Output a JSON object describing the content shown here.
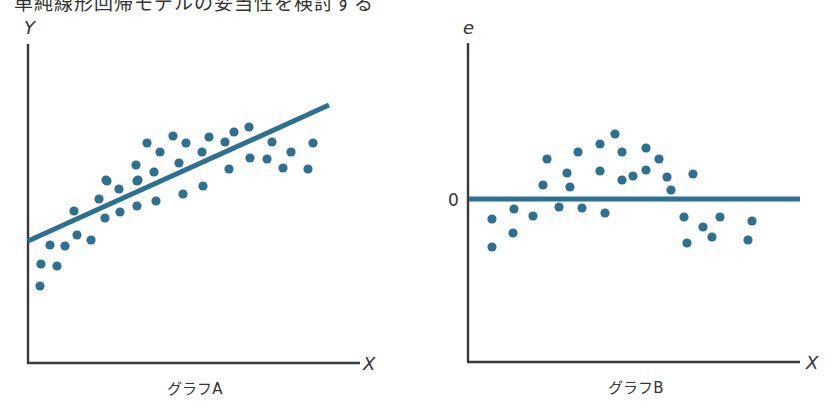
{
  "heading": "単純線形回帰モデルの妥当性を検討する",
  "colors": {
    "points": "#2f6f8f",
    "line": "#2e7090",
    "axes": "#3a3a3a"
  },
  "chart_data": [
    {
      "type": "scatter",
      "title": "グラフA",
      "xlabel": "X",
      "ylabel": "Y",
      "grid": false,
      "description": "Scatter of Y vs X with fitted regression line; points curve (concave) around the straight line",
      "fit_line": {
        "from_px": [
          28,
          241
        ],
        "to_px": [
          329,
          105
        ]
      },
      "points_px": [
        [
          40,
          286
        ],
        [
          41,
          264
        ],
        [
          57,
          266
        ],
        [
          50,
          245
        ],
        [
          65,
          246
        ],
        [
          77,
          235
        ],
        [
          91,
          240
        ],
        [
          74,
          211
        ],
        [
          99,
          199
        ],
        [
          105,
          218
        ],
        [
          107,
          181
        ],
        [
          119,
          189
        ],
        [
          120,
          212
        ],
        [
          106,
          180
        ],
        [
          137,
          206
        ],
        [
          137,
          181
        ],
        [
          136,
          165
        ],
        [
          138,
          180
        ],
        [
          147,
          143
        ],
        [
          154,
          172
        ],
        [
          156,
          201
        ],
        [
          160,
          152
        ],
        [
          173,
          136
        ],
        [
          179,
          163
        ],
        [
          183,
          194
        ],
        [
          186,
          143
        ],
        [
          202,
          152
        ],
        [
          203,
          186
        ],
        [
          209,
          137
        ],
        [
          225,
          142
        ],
        [
          229,
          169
        ],
        [
          234,
          132
        ],
        [
          249,
          127
        ],
        [
          250,
          158
        ],
        [
          267,
          159
        ],
        [
          272,
          142
        ],
        [
          283,
          168
        ],
        [
          291,
          152
        ],
        [
          308,
          169
        ],
        [
          313,
          143
        ]
      ]
    },
    {
      "type": "scatter",
      "title": "グラフB",
      "xlabel": "X",
      "ylabel": "e",
      "y_tick_labels": [
        "0"
      ],
      "grid": false,
      "description": "Residual plot: residuals e vs X showing an arch (curved) pattern around zero",
      "zero_line_px": {
        "y": 199,
        "x_from": 469,
        "x_to": 800
      },
      "points_px": [
        [
          492,
          219
        ],
        [
          492,
          247
        ],
        [
          514,
          209
        ],
        [
          513,
          233
        ],
        [
          533,
          216
        ],
        [
          543,
          185
        ],
        [
          547,
          159
        ],
        [
          559,
          207
        ],
        [
          567,
          173
        ],
        [
          570,
          187
        ],
        [
          578,
          152
        ],
        [
          582,
          208
        ],
        [
          600,
          144
        ],
        [
          600,
          171
        ],
        [
          605,
          213
        ],
        [
          615,
          134
        ],
        [
          622,
          152
        ],
        [
          622,
          180
        ],
        [
          633,
          176
        ],
        [
          646,
          148
        ],
        [
          646,
          170
        ],
        [
          659,
          159
        ],
        [
          667,
          177
        ],
        [
          671,
          190
        ],
        [
          693,
          174
        ],
        [
          684,
          217
        ],
        [
          687,
          243
        ],
        [
          703,
          227
        ],
        [
          712,
          237
        ],
        [
          720,
          217
        ],
        [
          752,
          221
        ],
        [
          748,
          240
        ]
      ]
    }
  ],
  "graphA": {
    "caption": "グラフA",
    "x_label": "X",
    "y_label": "Y"
  },
  "graphB": {
    "caption": "グラフB",
    "x_label": "X",
    "y_label": "e",
    "zero_label": "0"
  }
}
